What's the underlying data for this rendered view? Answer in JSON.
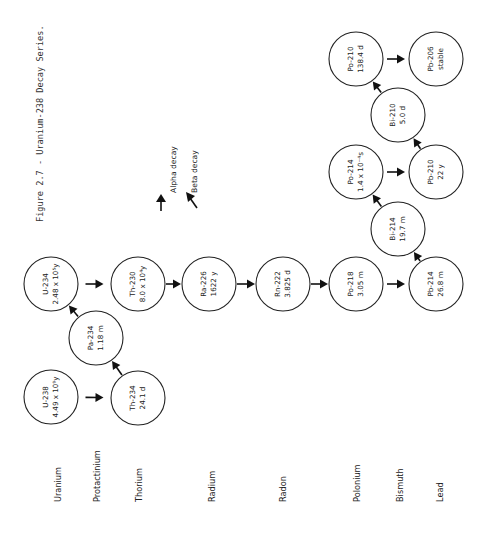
{
  "figure": {
    "caption": "Figure 2.7 - Uranium-238 Decay Series."
  },
  "legend": {
    "alpha_label": "Alpha decay",
    "beta_label": "Beta decay",
    "alpha_icon": "arrow-alpha-icon",
    "beta_icon": "arrow-beta-icon"
  },
  "elements": [
    {
      "name": "Uranium",
      "x": 58
    },
    {
      "name": "Protactinium",
      "x": 97
    },
    {
      "name": "Thorium",
      "x": 139
    },
    {
      "name": "Radium",
      "x": 212
    },
    {
      "name": "Radon",
      "x": 283
    },
    {
      "name": "Polonium",
      "x": 357
    },
    {
      "name": "Bismuth",
      "x": 400
    },
    {
      "name": "Lead",
      "x": 440
    }
  ],
  "nuclides": [
    {
      "id": "U-238",
      "label": "U-238",
      "half_life": "4.49 x 10⁹y",
      "cx": 51,
      "cy": 397
    },
    {
      "id": "Th-234",
      "label": "Th-234",
      "half_life": "24.1 d",
      "cx": 138,
      "cy": 398
    },
    {
      "id": "Pa-234",
      "label": "Pa-234",
      "half_life": "1.18 m",
      "cx": 96,
      "cy": 338
    },
    {
      "id": "U-234",
      "label": "U-234",
      "half_life": "2.48 x 10⁵y",
      "cx": 51,
      "cy": 284
    },
    {
      "id": "Th-230",
      "label": "Th-230",
      "half_life": "8.0 x 10⁴y",
      "cx": 138,
      "cy": 284
    },
    {
      "id": "Ra-226",
      "label": "Ra-226",
      "half_life": "1622 y",
      "cx": 209,
      "cy": 284
    },
    {
      "id": "Rn-222",
      "label": "Rn-222",
      "half_life": "3.825 d",
      "cx": 283,
      "cy": 284
    },
    {
      "id": "Po-218",
      "label": "Po-218",
      "half_life": "3.05 m",
      "cx": 356,
      "cy": 284
    },
    {
      "id": "Pb-214",
      "label": "Pb-214",
      "half_life": "26.8 m",
      "cx": 436,
      "cy": 284
    },
    {
      "id": "Bi-214",
      "label": "Bi-214",
      "half_life": "19.7 m",
      "cx": 398,
      "cy": 229
    },
    {
      "id": "Po-214",
      "label": "Po-214",
      "half_life": "1.4 x 10⁻⁴s",
      "cx": 356,
      "cy": 172
    },
    {
      "id": "Pb-210",
      "label": "Pb-210",
      "half_life": "22 y",
      "cx": 436,
      "cy": 172
    },
    {
      "id": "Bi-210",
      "label": "Bi-210",
      "half_life": "5.0 d",
      "cx": 398,
      "cy": 115
    },
    {
      "id": "Po-210",
      "label": "Po-210",
      "half_life": "138.4 d",
      "cx": 356,
      "cy": 59
    },
    {
      "id": "Pb-206",
      "label": "Pb-206",
      "half_life": "stable",
      "cx": 436,
      "cy": 59
    }
  ],
  "decays": [
    {
      "from": "U-238",
      "to": "Th-234",
      "type": "alpha"
    },
    {
      "from": "Th-234",
      "to": "Pa-234",
      "type": "beta"
    },
    {
      "from": "Pa-234",
      "to": "U-234",
      "type": "beta"
    },
    {
      "from": "U-234",
      "to": "Th-230",
      "type": "alpha"
    },
    {
      "from": "Th-230",
      "to": "Ra-226",
      "type": "alpha"
    },
    {
      "from": "Ra-226",
      "to": "Rn-222",
      "type": "alpha"
    },
    {
      "from": "Rn-222",
      "to": "Po-218",
      "type": "alpha"
    },
    {
      "from": "Po-218",
      "to": "Pb-214",
      "type": "alpha"
    },
    {
      "from": "Pb-214",
      "to": "Bi-214",
      "type": "beta"
    },
    {
      "from": "Bi-214",
      "to": "Po-214",
      "type": "beta"
    },
    {
      "from": "Po-214",
      "to": "Pb-210",
      "type": "alpha"
    },
    {
      "from": "Pb-210",
      "to": "Bi-210",
      "type": "beta"
    },
    {
      "from": "Bi-210",
      "to": "Po-210",
      "type": "beta"
    },
    {
      "from": "Po-210",
      "to": "Pb-206",
      "type": "alpha"
    }
  ],
  "style": {
    "ink_color": "#222222",
    "background": "#ffffff",
    "node_radius": 27
  }
}
